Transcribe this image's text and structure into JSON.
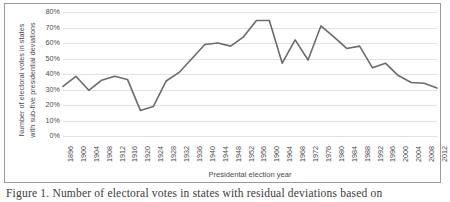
{
  "figure": {
    "caption": "Figure 1.  Number of electoral votes in states with residual deviations based on"
  },
  "chart_data": {
    "type": "line",
    "title": "",
    "xlabel": "Presidental election year",
    "ylabel": "Number of electoral votes in states with sub-five presidential deviations",
    "ylabel_line1": "Number of electoral votes in states",
    "ylabel_line2": "with sub-five presidential deviations",
    "ylim": [
      0,
      80
    ],
    "ytick_labels": [
      "80%",
      "70%",
      "60%",
      "50%",
      "40%",
      "30%",
      "20%",
      "10%",
      "0%"
    ],
    "ytick_values": [
      80,
      70,
      60,
      50,
      40,
      30,
      20,
      10,
      0
    ],
    "grid": true,
    "legend": "none",
    "line_color": "#6b6b6b",
    "categories": [
      "1896",
      "1900",
      "1904",
      "1908",
      "1912",
      "1916",
      "1920",
      "1924",
      "1928",
      "1932",
      "1936",
      "1940",
      "1944",
      "1948",
      "1952",
      "1956",
      "1960",
      "1964",
      "1968",
      "1972",
      "1976",
      "1980",
      "1984",
      "1988",
      "1992",
      "1996",
      "2000",
      "2004",
      "2008",
      "2012"
    ],
    "values": [
      32,
      38.5,
      29.5,
      36,
      38.5,
      36.5,
      16.5,
      19,
      35.5,
      41,
      50,
      59,
      60,
      58,
      64,
      74.5,
      74.5,
      47,
      62,
      49,
      71,
      64,
      56.5,
      58,
      44,
      47,
      39,
      34.5,
      34,
      31
    ]
  }
}
